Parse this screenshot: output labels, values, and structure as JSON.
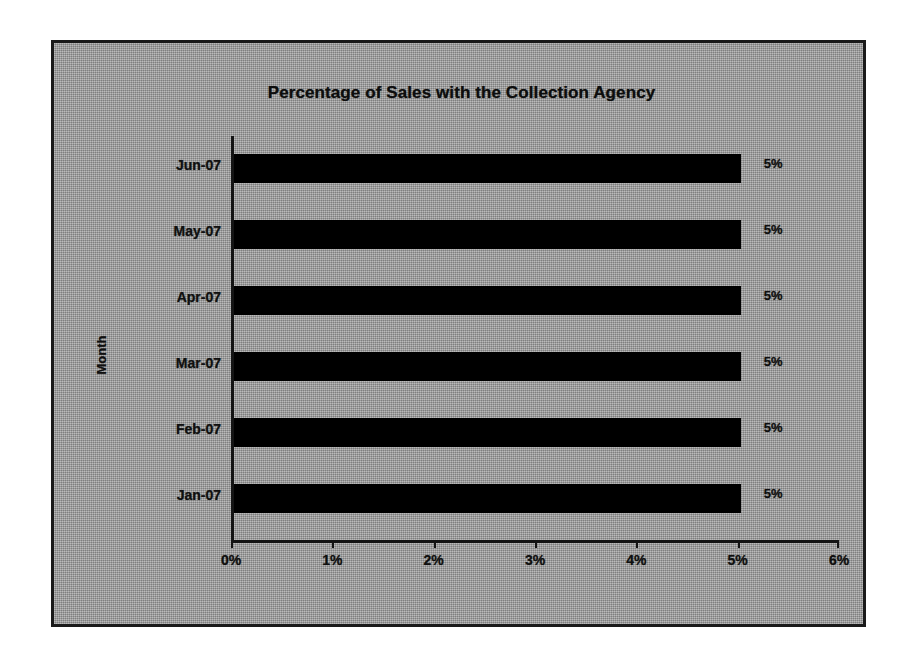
{
  "chart_data": {
    "type": "bar",
    "orientation": "horizontal",
    "title": "Percentage of Sales with the Collection Agency",
    "xlabel": "",
    "ylabel": "Month",
    "categories": [
      "Jun-07",
      "May-07",
      "Apr-07",
      "Mar-07",
      "Feb-07",
      "Jan-07"
    ],
    "values": [
      5,
      5,
      5,
      5,
      5,
      5
    ],
    "data_labels": [
      "5%",
      "5%",
      "5%",
      "5%",
      "5%",
      "5%"
    ],
    "xlim": [
      0,
      6
    ],
    "xticks": [
      0,
      1,
      2,
      3,
      4,
      5,
      6
    ],
    "xtick_labels": [
      "0%",
      "1%",
      "2%",
      "3%",
      "4%",
      "5%",
      "6%"
    ],
    "grid": false,
    "legend": false,
    "series": [
      {
        "name": "Percentage of Sales with the Collection Agency",
        "values": [
          5,
          5,
          5,
          5,
          5,
          5
        ],
        "color": "#000000"
      }
    ],
    "colors": {
      "bar": "#000000",
      "plot_background": "#9d9d9d",
      "axis": "#141414",
      "text": "#0f0f0f",
      "frame_border": "#1a1a1a",
      "page_background": "#ffffff"
    }
  }
}
